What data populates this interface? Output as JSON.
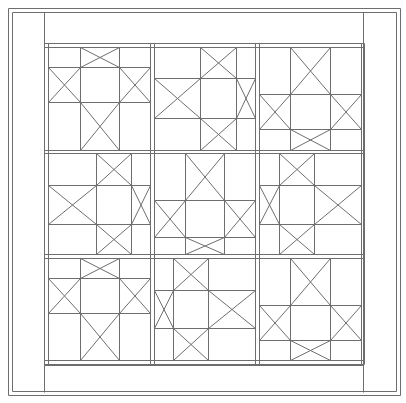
{
  "diagram": {
    "title": "",
    "width": 406,
    "height": 403,
    "stroke_color": "#6e6e6e",
    "background": "#ffffff",
    "outer_frame": {
      "x1": 8,
      "y1": 8,
      "x2": 400,
      "y2": 395,
      "inset": 4
    },
    "inner_border": {
      "x1": 44,
      "y1": 12,
      "x2": 363,
      "y2": 392,
      "top_band": 43,
      "bottom_band": 365
    },
    "grid": {
      "x_lines": [
        44,
        48,
        150,
        154,
        255,
        259,
        361,
        364
      ],
      "y_lines": [
        43,
        47,
        150,
        153,
        254,
        258,
        360,
        364
      ]
    },
    "blocks": [
      {
        "name": "block-r1c1",
        "x": 48,
        "y": 47,
        "w": 102,
        "h": 103,
        "vx": [
          80,
          119
        ],
        "hy": [
          67,
          102
        ]
      },
      {
        "name": "block-r1c2",
        "x": 154,
        "y": 47,
        "w": 101,
        "h": 103,
        "vx": [
          200,
          236
        ],
        "hy": [
          78,
          118
        ]
      },
      {
        "name": "block-r1c3",
        "x": 259,
        "y": 47,
        "w": 102,
        "h": 103,
        "vx": [
          290,
          330
        ],
        "hy": [
          94,
          129
        ]
      },
      {
        "name": "block-r2c1",
        "x": 48,
        "y": 153,
        "w": 102,
        "h": 101,
        "vx": [
          96,
          131
        ],
        "hy": [
          185,
          224
        ]
      },
      {
        "name": "block-r2c2",
        "x": 154,
        "y": 153,
        "w": 101,
        "h": 101,
        "vx": [
          185,
          224
        ],
        "hy": [
          200,
          237
        ]
      },
      {
        "name": "block-r2c3",
        "x": 259,
        "y": 153,
        "w": 102,
        "h": 101,
        "vx": [
          279,
          314
        ],
        "hy": [
          185,
          224
        ]
      },
      {
        "name": "block-r3c1",
        "x": 48,
        "y": 258,
        "w": 102,
        "h": 102,
        "vx": [
          80,
          119
        ],
        "hy": [
          278,
          313
        ]
      },
      {
        "name": "block-r3c2",
        "x": 154,
        "y": 258,
        "w": 101,
        "h": 102,
        "vx": [
          173,
          208
        ],
        "hy": [
          290,
          328
        ]
      },
      {
        "name": "block-r3c3",
        "x": 259,
        "y": 258,
        "w": 102,
        "h": 102,
        "vx": [
          290,
          330
        ],
        "hy": [
          305,
          340
        ]
      }
    ]
  }
}
